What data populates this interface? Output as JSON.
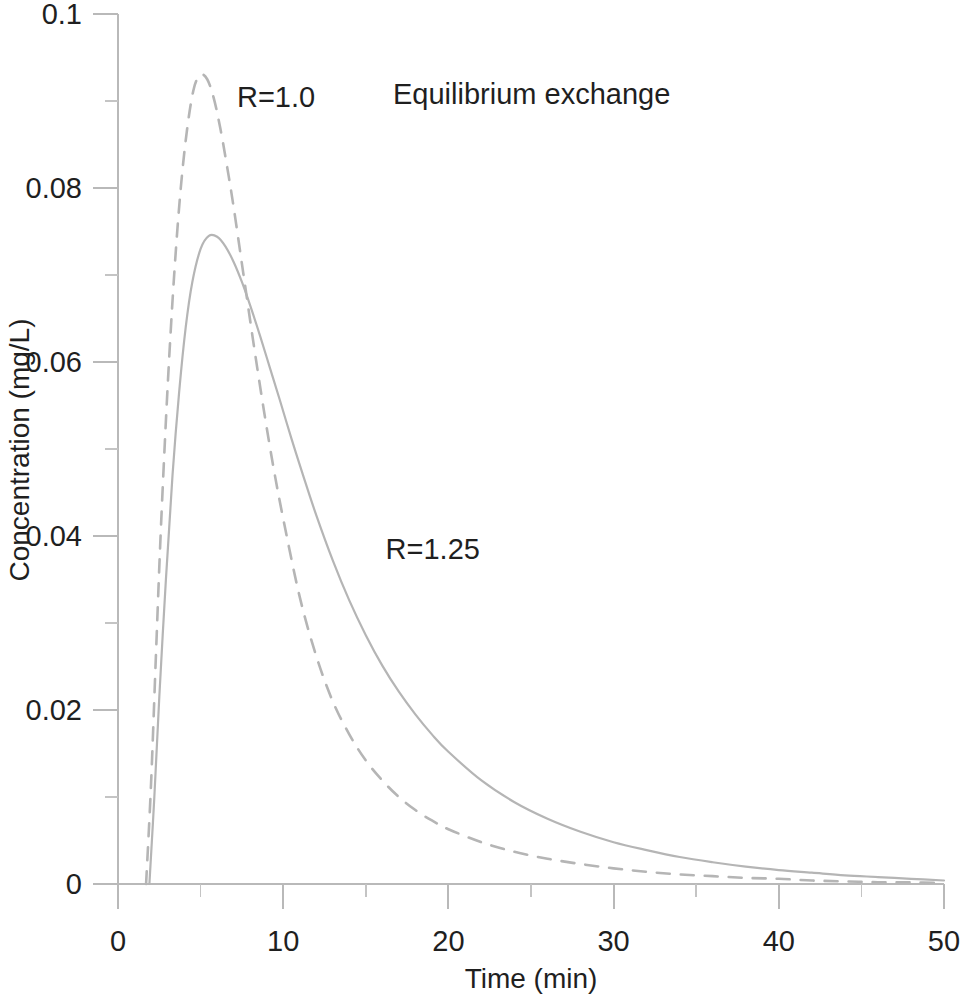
{
  "chart_data": {
    "type": "line",
    "title": "Equilibrium exchange",
    "xlabel": "Time (min)",
    "ylabel": "Concentration (mg/L)",
    "xlim": [
      0,
      50
    ],
    "ylim": [
      0,
      0.1
    ],
    "grid": false,
    "legend_position": "inline-annotations",
    "x_ticks": [
      0,
      10,
      20,
      30,
      40,
      50
    ],
    "x_tick_labels": [
      "0",
      "10",
      "20",
      "30",
      "40",
      "50"
    ],
    "x_minor_ticks": [
      5,
      15,
      25,
      35,
      45
    ],
    "y_ticks": [
      0,
      0.02,
      0.04,
      0.06,
      0.08,
      0.1
    ],
    "y_tick_labels": [
      "0",
      "0.02",
      "0.04",
      "0.06",
      "0.08",
      "0.1"
    ],
    "y_minor_ticks": [
      0.01,
      0.03,
      0.05,
      0.07,
      0.09
    ],
    "annotations": [
      {
        "text": "R=1.0",
        "x": 7.2,
        "y": 0.0905
      },
      {
        "text": "R=1.25",
        "x": 16.2,
        "y": 0.0385
      }
    ],
    "series": [
      {
        "name": "R=1.0",
        "label": "R=1.0",
        "style": "dashed",
        "color": "#b5b5b5",
        "x": [
          1.7,
          2.0,
          2.3,
          2.6,
          3.0,
          3.4,
          3.8,
          4.2,
          4.6,
          5.0,
          5.4,
          5.8,
          6.2,
          6.6,
          7.0,
          7.6,
          8.2,
          8.8,
          9.4,
          10.0,
          11.0,
          12.0,
          13.0,
          14.0,
          15.0,
          16.0,
          17.0,
          18.0,
          19.0,
          20.0,
          22.0,
          24.0,
          26.0,
          28.0,
          30.0,
          32.0,
          34.0,
          36.0,
          38.0,
          40.0,
          42.0,
          44.0,
          46.0,
          48.0,
          50.0
        ],
        "y": [
          0.0,
          0.0115,
          0.0265,
          0.041,
          0.057,
          0.07,
          0.08,
          0.087,
          0.0915,
          0.093,
          0.0925,
          0.0903,
          0.0868,
          0.0825,
          0.0778,
          0.07,
          0.0622,
          0.0548,
          0.048,
          0.042,
          0.033,
          0.0262,
          0.021,
          0.0172,
          0.0142,
          0.0119,
          0.01,
          0.0085,
          0.0073,
          0.0063,
          0.0048,
          0.0037,
          0.0029,
          0.0023,
          0.0018,
          0.0014,
          0.0011,
          0.0009,
          0.0007,
          0.0006,
          0.0004,
          0.0003,
          0.0002,
          0.0002,
          0.0001
        ]
      },
      {
        "name": "R=1.25",
        "label": "R=1.25",
        "style": "solid",
        "color": "#b5b5b5",
        "x": [
          1.9,
          2.2,
          2.5,
          2.9,
          3.3,
          3.7,
          4.1,
          4.5,
          5.0,
          5.5,
          6.0,
          6.5,
          7.0,
          7.5,
          8.0,
          8.6,
          9.2,
          9.8,
          10.5,
          11.2,
          12.0,
          13.0,
          14.0,
          15.0,
          16.0,
          17.0,
          18.0,
          19.0,
          20.0,
          22.0,
          24.0,
          26.0,
          28.0,
          30.0,
          32.0,
          34.0,
          36.0,
          38.0,
          40.0,
          42.0,
          44.0,
          46.0,
          48.0,
          50.0
        ],
        "y": [
          0.0,
          0.01,
          0.0215,
          0.035,
          0.047,
          0.0565,
          0.064,
          0.0692,
          0.073,
          0.0745,
          0.0744,
          0.0733,
          0.0715,
          0.0692,
          0.0665,
          0.063,
          0.0593,
          0.0556,
          0.0512,
          0.047,
          0.0424,
          0.0372,
          0.0326,
          0.0286,
          0.0251,
          0.0221,
          0.0195,
          0.0172,
          0.0152,
          0.0119,
          0.0094,
          0.0075,
          0.006,
          0.0048,
          0.0039,
          0.0031,
          0.0025,
          0.002,
          0.0016,
          0.0013,
          0.001,
          0.0008,
          0.0006,
          0.0004
        ]
      }
    ]
  }
}
